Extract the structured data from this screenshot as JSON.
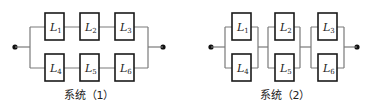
{
  "systems": [
    {
      "caption": "系统（1）",
      "topology": "two series chains in parallel",
      "components": [
        {
          "name": "L",
          "sub": "1"
        },
        {
          "name": "L",
          "sub": "2"
        },
        {
          "name": "L",
          "sub": "3"
        },
        {
          "name": "L",
          "sub": "4"
        },
        {
          "name": "L",
          "sub": "5"
        },
        {
          "name": "L",
          "sub": "6"
        }
      ]
    },
    {
      "caption": "系统（2）",
      "topology": "three parallel pairs in series",
      "components": [
        {
          "name": "L",
          "sub": "1"
        },
        {
          "name": "L",
          "sub": "2"
        },
        {
          "name": "L",
          "sub": "3"
        },
        {
          "name": "L",
          "sub": "4"
        },
        {
          "name": "L",
          "sub": "5"
        },
        {
          "name": "L",
          "sub": "6"
        }
      ]
    }
  ],
  "colors": {
    "wire": "#7a7a7a",
    "box": "#1a1a1a",
    "dot": "#111111"
  }
}
